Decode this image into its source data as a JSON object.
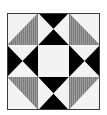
{
  "figure": {
    "kind": "quilt-block",
    "grid": {
      "rows": 3,
      "cols": 3
    },
    "colors": {
      "background": "#f4f4f4",
      "dark": "#000000",
      "grey": "#7f7f7f",
      "grey_stripe": "#a6a6a6",
      "light": "#f2f2f2",
      "border": "#3a3a3a"
    },
    "cells": [
      {
        "pos": "top-left",
        "type": "half-square",
        "grey_half": "lower-right"
      },
      {
        "pos": "top-center",
        "type": "hourglass",
        "dark": "top-bottom"
      },
      {
        "pos": "top-right",
        "type": "half-square",
        "grey_half": "lower-left"
      },
      {
        "pos": "middle-left",
        "type": "hourglass",
        "dark": "left-right"
      },
      {
        "pos": "center",
        "type": "plain",
        "fill": "light"
      },
      {
        "pos": "middle-right",
        "type": "hourglass",
        "dark": "left-right"
      },
      {
        "pos": "bottom-left",
        "type": "half-square",
        "grey_half": "upper-right"
      },
      {
        "pos": "bottom-center",
        "type": "hourglass",
        "dark": "top-bottom"
      },
      {
        "pos": "bottom-right",
        "type": "half-square",
        "grey_half": "upper-left"
      }
    ]
  }
}
